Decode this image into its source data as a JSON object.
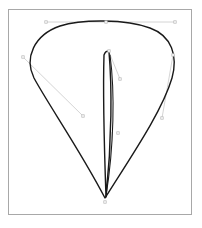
{
  "canvas": {
    "width": 202,
    "height": 228,
    "background_color": "#ffffff",
    "frame": {
      "label": "drawing-frame",
      "x": 8,
      "y": 9,
      "width": 184,
      "height": 206,
      "stroke_color": "#a8a8a8",
      "stroke_width": 1,
      "fill_color": "#ffffff"
    }
  },
  "style": {
    "path_stroke_color": "#1a1a1a",
    "path_stroke_width": 1.4,
    "path_fill": "none",
    "handle_line_color": "#c9c9c9",
    "handle_line_width": 0.8,
    "handle_node_color": "#b4b4b4",
    "handle_node_size": 2.4
  },
  "shapes": [
    {
      "name": "outer-teardrop-path",
      "role": "primary-outline",
      "closed": true,
      "description": "Inverted teardrop / petal outline with apex at bottom center",
      "anchors": [
        {
          "name": "apex-bottom",
          "x": 105,
          "y": 198
        },
        {
          "name": "left-shoulder",
          "x": 33,
          "y": 62
        },
        {
          "name": "top-crest",
          "x": 106,
          "y": 22
        },
        {
          "name": "right-shoulder",
          "x": 166,
          "y": 66
        }
      ],
      "d": "M 105 198 C 80 150 48 104 34 78 C 24 58 34 35 60 26 C 82 19 126 19 150 28 C 172 36 178 56 172 78 C 162 112 130 158 105 198 Z"
    },
    {
      "name": "inner-sliver-path",
      "role": "secondary-outline",
      "closed": true,
      "description": "Narrow elongated leaf / sliver from upper-middle down to the shared apex",
      "anchors": [
        {
          "name": "sliver-top",
          "x": 109,
          "y": 52
        },
        {
          "name": "sliver-bottom",
          "x": 105,
          "y": 198
        }
      ],
      "d": "M 109 52 C 112 86 112 140 106 197 C 104 140 103 88 104 55 C 105 52 107 50 109 52 Z"
    },
    {
      "name": "inner-sliver-crease",
      "role": "secondary-detail",
      "closed": false,
      "description": "Inner crease stroke paralleling the sliver right edge",
      "d": "M 110 55 C 115 92 114 146 106 196"
    }
  ],
  "handles": [
    {
      "name": "top-horizontal-handle",
      "from": {
        "x": 46,
        "y": 22
      },
      "to": {
        "x": 175,
        "y": 22
      },
      "nodes": [
        {
          "name": "handle-node-top-left",
          "x": 46,
          "y": 22
        },
        {
          "name": "handle-node-top-center",
          "x": 106,
          "y": 22
        },
        {
          "name": "handle-node-top-right",
          "x": 175,
          "y": 22
        }
      ]
    },
    {
      "name": "left-shoulder-handle",
      "from": {
        "x": 23,
        "y": 57
      },
      "to": {
        "x": 83,
        "y": 116
      },
      "nodes": [
        {
          "name": "handle-node-left-upper",
          "x": 23,
          "y": 57
        },
        {
          "name": "handle-node-left-lower",
          "x": 83,
          "y": 116
        }
      ]
    },
    {
      "name": "right-shoulder-handle",
      "from": {
        "x": 173,
        "y": 55
      },
      "to": {
        "x": 162,
        "y": 118
      },
      "nodes": [
        {
          "name": "handle-node-right-upper",
          "x": 173,
          "y": 55
        },
        {
          "name": "handle-node-right-lower",
          "x": 162,
          "y": 118
        }
      ]
    },
    {
      "name": "sliver-upper-handle",
      "from": {
        "x": 109,
        "y": 52
      },
      "to": {
        "x": 120,
        "y": 79
      },
      "nodes": [
        {
          "name": "handle-node-sliver-top",
          "x": 109,
          "y": 51
        },
        {
          "name": "handle-node-sliver-upper-mid",
          "x": 120,
          "y": 79
        }
      ]
    },
    {
      "name": "sliver-lower-handle",
      "from": {
        "x": 112,
        "y": 132
      },
      "to": {
        "x": 106,
        "y": 197
      },
      "nodes": [
        {
          "name": "handle-node-sliver-lower-mid",
          "x": 118,
          "y": 133
        },
        {
          "name": "handle-node-apex",
          "x": 105,
          "y": 202
        }
      ]
    }
  ]
}
